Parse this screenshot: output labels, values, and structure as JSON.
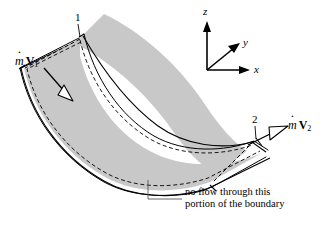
{
  "figure": {
    "colors": {
      "duct_fill": "#c8c8c8",
      "outline": "#000000",
      "dashed_boundary": "#000000",
      "arrow_fill": "#ffffff",
      "leader": "#555555"
    }
  },
  "axes": {
    "z_label": "z",
    "y_label": "y",
    "x_label": "x"
  },
  "stations": [
    {
      "id": "inlet",
      "label": "1"
    },
    {
      "id": "outlet",
      "label": "2"
    }
  ],
  "flux": {
    "inlet": {
      "mdot": "m",
      "vector": "V",
      "subscript": "1"
    },
    "outlet": {
      "mdot": "m",
      "vector": "V",
      "subscript": "2"
    }
  },
  "caption": {
    "line1": "no flow through this",
    "line2": "portion of the boundary"
  }
}
